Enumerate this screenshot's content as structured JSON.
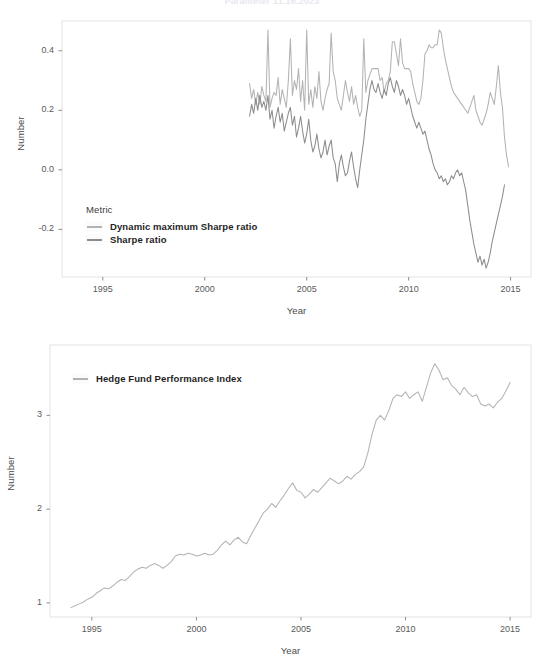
{
  "page": {
    "title": "Parameter 11.16.2023"
  },
  "chart_data": [
    {
      "type": "line",
      "id": "sharpe-ratios",
      "title": "",
      "xlabel": "Year",
      "ylabel": "Number",
      "xlim": [
        1993.0,
        2016.0
      ],
      "ylim": [
        -0.36,
        0.5
      ],
      "xticks": [
        1995,
        2000,
        2005,
        2010,
        2015
      ],
      "yticks": [
        -0.2,
        0.0,
        0.2,
        0.4
      ],
      "ytick_labels": [
        "-0.2",
        "0.0",
        "0.2",
        "0.4"
      ],
      "xtick_labels": [
        "1995",
        "2000",
        "2005",
        "2010",
        "2015"
      ],
      "grid": false,
      "legend": {
        "title": "Metric",
        "position": "inside-bottom-left",
        "entries": [
          {
            "label": "Dynamic maximum Sharpe ratio",
            "color": "#b3b3b3"
          },
          {
            "label": "Sharpe ratio",
            "color": "#8c8c8c"
          }
        ]
      },
      "series": [
        {
          "name": "Dynamic maximum Sharpe ratio",
          "color": "#b3b3b3",
          "x": [
            2002.2,
            2002.3,
            2002.4,
            2002.5,
            2002.6,
            2002.7,
            2002.8,
            2002.9,
            2003.0,
            2003.1,
            2003.2,
            2003.3,
            2003.4,
            2003.5,
            2003.6,
            2003.7,
            2003.8,
            2003.9,
            2004.0,
            2004.1,
            2004.2,
            2004.3,
            2004.4,
            2004.5,
            2004.6,
            2004.7,
            2004.8,
            2004.9,
            2005.0,
            2005.1,
            2005.2,
            2005.3,
            2005.4,
            2005.5,
            2005.6,
            2005.7,
            2005.8,
            2005.9,
            2006.0,
            2006.1,
            2006.2,
            2006.3,
            2006.4,
            2006.5,
            2006.6,
            2006.7,
            2006.8,
            2006.9,
            2007.0,
            2007.1,
            2007.2,
            2007.3,
            2007.4,
            2007.5,
            2007.6,
            2007.7,
            2007.8,
            2007.9,
            2008.0,
            2008.1,
            2008.2,
            2008.3,
            2008.4,
            2008.5,
            2008.6,
            2008.7,
            2008.8,
            2008.9,
            2009.0,
            2009.1,
            2009.2,
            2009.3,
            2009.4,
            2009.5,
            2009.6,
            2009.7,
            2009.8,
            2009.9,
            2010.0,
            2010.1,
            2010.2,
            2010.3,
            2010.4,
            2010.5,
            2010.6,
            2010.7,
            2010.8,
            2010.9,
            2011.0,
            2011.1,
            2011.2,
            2011.3,
            2011.4,
            2011.5,
            2011.6,
            2011.7,
            2011.8,
            2011.9,
            2012.0,
            2012.1,
            2012.2,
            2012.3,
            2012.4,
            2012.5,
            2012.6,
            2012.7,
            2012.8,
            2012.9,
            2013.0,
            2013.1,
            2013.2,
            2013.3,
            2013.4,
            2013.5,
            2013.6,
            2013.7,
            2013.8,
            2013.9,
            2014.0,
            2014.1,
            2014.2,
            2014.3,
            2014.4,
            2014.5,
            2014.6,
            2014.7,
            2014.8,
            2014.9
          ],
          "y": [
            0.29,
            0.24,
            0.27,
            0.22,
            0.26,
            0.22,
            0.28,
            0.25,
            0.23,
            0.47,
            0.21,
            0.24,
            0.26,
            0.25,
            0.31,
            0.22,
            0.27,
            0.24,
            0.21,
            0.3,
            0.44,
            0.25,
            0.3,
            0.27,
            0.34,
            0.23,
            0.3,
            0.2,
            0.47,
            0.22,
            0.27,
            0.21,
            0.28,
            0.24,
            0.33,
            0.23,
            0.2,
            0.24,
            0.27,
            0.29,
            0.46,
            0.33,
            0.3,
            0.24,
            0.22,
            0.2,
            0.25,
            0.3,
            0.26,
            0.23,
            0.28,
            0.22,
            0.25,
            0.21,
            0.18,
            0.2,
            0.44,
            0.26,
            0.3,
            0.32,
            0.34,
            0.34,
            0.34,
            0.34,
            0.3,
            0.31,
            0.26,
            0.29,
            0.3,
            0.33,
            0.43,
            0.43,
            0.39,
            0.35,
            0.44,
            0.36,
            0.34,
            0.34,
            0.34,
            0.33,
            0.29,
            0.26,
            0.23,
            0.22,
            0.24,
            0.3,
            0.39,
            0.4,
            0.42,
            0.41,
            0.41,
            0.42,
            0.42,
            0.47,
            0.46,
            0.41,
            0.37,
            0.34,
            0.31,
            0.28,
            0.26,
            0.25,
            0.24,
            0.23,
            0.22,
            0.21,
            0.2,
            0.19,
            0.21,
            0.23,
            0.25,
            0.2,
            0.18,
            0.16,
            0.15,
            0.17,
            0.19,
            0.22,
            0.26,
            0.24,
            0.22,
            0.28,
            0.35,
            0.26,
            0.21,
            0.11,
            0.05,
            0.01
          ],
          "stat_summary": "Volatile 0.15-0.48 band, no sustained drift"
        },
        {
          "name": "Sharpe ratio",
          "color": "#8c8c8c",
          "x": [
            2002.2,
            2002.3,
            2002.4,
            2002.5,
            2002.6,
            2002.7,
            2002.8,
            2002.9,
            2003.0,
            2003.1,
            2003.2,
            2003.3,
            2003.4,
            2003.5,
            2003.6,
            2003.7,
            2003.8,
            2003.9,
            2004.0,
            2004.1,
            2004.2,
            2004.3,
            2004.4,
            2004.5,
            2004.6,
            2004.7,
            2004.8,
            2004.9,
            2005.0,
            2005.1,
            2005.2,
            2005.3,
            2005.4,
            2005.5,
            2005.6,
            2005.7,
            2005.8,
            2005.9,
            2006.0,
            2006.1,
            2006.2,
            2006.3,
            2006.4,
            2006.5,
            2006.6,
            2006.7,
            2006.8,
            2006.9,
            2007.0,
            2007.1,
            2007.2,
            2007.3,
            2007.4,
            2007.5,
            2007.6,
            2007.7,
            2007.8,
            2007.9,
            2008.0,
            2008.1,
            2008.2,
            2008.3,
            2008.4,
            2008.5,
            2008.6,
            2008.7,
            2008.8,
            2008.9,
            2009.0,
            2009.1,
            2009.2,
            2009.3,
            2009.4,
            2009.5,
            2009.6,
            2009.7,
            2009.8,
            2009.9,
            2010.0,
            2010.1,
            2010.2,
            2010.3,
            2010.4,
            2010.5,
            2010.6,
            2010.7,
            2010.8,
            2010.9,
            2011.0,
            2011.1,
            2011.2,
            2011.3,
            2011.4,
            2011.5,
            2011.6,
            2011.7,
            2011.8,
            2011.9,
            2012.0,
            2012.1,
            2012.2,
            2012.3,
            2012.4,
            2012.5,
            2012.6,
            2012.7,
            2012.8,
            2012.9,
            2013.0,
            2013.1,
            2013.2,
            2013.3,
            2013.4,
            2013.5,
            2013.6,
            2013.7,
            2013.8,
            2013.9,
            2014.0,
            2014.1,
            2014.2,
            2014.3,
            2014.4,
            2014.5,
            2014.6,
            2014.7,
            2014.8,
            2014.9
          ],
          "y": [
            0.18,
            0.22,
            0.19,
            0.24,
            0.2,
            0.25,
            0.21,
            0.23,
            0.2,
            0.25,
            0.17,
            0.2,
            0.14,
            0.18,
            0.21,
            0.16,
            0.19,
            0.13,
            0.16,
            0.19,
            0.21,
            0.15,
            0.18,
            0.11,
            0.14,
            0.18,
            0.13,
            0.09,
            0.12,
            0.17,
            0.1,
            0.06,
            0.08,
            0.12,
            0.07,
            0.04,
            0.06,
            0.1,
            0.05,
            0.08,
            0.1,
            0.04,
            0.02,
            -0.04,
            0.02,
            0.05,
            0.01,
            -0.02,
            -0.01,
            0.03,
            0.06,
            0.01,
            -0.03,
            -0.06,
            0.0,
            0.05,
            0.1,
            0.17,
            0.22,
            0.27,
            0.3,
            0.27,
            0.26,
            0.29,
            0.26,
            0.24,
            0.27,
            0.25,
            0.29,
            0.31,
            0.28,
            0.26,
            0.3,
            0.28,
            0.25,
            0.27,
            0.25,
            0.22,
            0.24,
            0.21,
            0.18,
            0.16,
            0.14,
            0.16,
            0.14,
            0.12,
            0.13,
            0.1,
            0.07,
            0.05,
            0.02,
            0.0,
            -0.01,
            -0.03,
            -0.02,
            -0.04,
            -0.03,
            -0.05,
            -0.04,
            -0.02,
            -0.03,
            -0.01,
            0.0,
            -0.02,
            -0.01,
            -0.04,
            -0.07,
            -0.12,
            -0.17,
            -0.21,
            -0.25,
            -0.28,
            -0.31,
            -0.29,
            -0.32,
            -0.3,
            -0.33,
            -0.31,
            -0.28,
            -0.24,
            -0.21,
            -0.18,
            -0.15,
            -0.12,
            -0.09,
            -0.05
          ],
          "stat_summary": "Starts near 0.18, declines to about -0.33 by 2014, rebound at end"
        }
      ]
    },
    {
      "type": "line",
      "id": "hedge-fund-performance-index",
      "title": "",
      "xlabel": "Year",
      "ylabel": "Number",
      "xlim": [
        1993.0,
        2016.0
      ],
      "ylim": [
        0.85,
        3.75
      ],
      "xticks": [
        1995,
        2000,
        2005,
        2010,
        2015
      ],
      "yticks": [
        1,
        2,
        3
      ],
      "ytick_labels": [
        "1",
        "2",
        "3"
      ],
      "xtick_labels": [
        "1995",
        "2000",
        "2005",
        "2010",
        "2015"
      ],
      "grid": false,
      "legend": {
        "title": "",
        "position": "inside-top-left",
        "entries": [
          {
            "label": "Hedge Fund Performance Index",
            "color": "#b3b3b3"
          }
        ]
      },
      "series": [
        {
          "name": "Hedge Fund Performance Index",
          "color": "#b3b3b3",
          "x": [
            1994.0,
            1994.2,
            1994.4,
            1994.6,
            1994.8,
            1995.0,
            1995.2,
            1995.4,
            1995.6,
            1995.8,
            1996.0,
            1996.2,
            1996.4,
            1996.6,
            1996.8,
            1997.0,
            1997.2,
            1997.4,
            1997.6,
            1997.8,
            1998.0,
            1998.2,
            1998.4,
            1998.6,
            1998.8,
            1999.0,
            1999.2,
            1999.4,
            1999.6,
            1999.8,
            2000.0,
            2000.2,
            2000.4,
            2000.6,
            2000.8,
            2001.0,
            2001.2,
            2001.4,
            2001.6,
            2001.8,
            2002.0,
            2002.2,
            2002.4,
            2002.6,
            2002.8,
            2003.0,
            2003.2,
            2003.4,
            2003.6,
            2003.8,
            2004.0,
            2004.2,
            2004.4,
            2004.6,
            2004.8,
            2005.0,
            2005.2,
            2005.4,
            2005.6,
            2005.8,
            2006.0,
            2006.2,
            2006.4,
            2006.6,
            2006.8,
            2007.0,
            2007.2,
            2007.4,
            2007.6,
            2007.8,
            2008.0,
            2008.2,
            2008.4,
            2008.6,
            2008.8,
            2009.0,
            2009.2,
            2009.4,
            2009.6,
            2009.8,
            2010.0,
            2010.2,
            2010.4,
            2010.6,
            2010.8,
            2011.0,
            2011.2,
            2011.4,
            2011.6,
            2011.8,
            2012.0,
            2012.2,
            2012.4,
            2012.6,
            2012.8,
            2013.0,
            2013.2,
            2013.4,
            2013.6,
            2013.8,
            2014.0,
            2014.2,
            2014.4,
            2014.6,
            2014.8,
            2015.0
          ],
          "y": [
            0.95,
            0.97,
            0.99,
            1.01,
            1.04,
            1.06,
            1.1,
            1.13,
            1.16,
            1.15,
            1.18,
            1.22,
            1.25,
            1.24,
            1.28,
            1.33,
            1.36,
            1.38,
            1.37,
            1.4,
            1.42,
            1.4,
            1.37,
            1.4,
            1.44,
            1.5,
            1.52,
            1.51,
            1.53,
            1.52,
            1.5,
            1.51,
            1.53,
            1.51,
            1.52,
            1.56,
            1.62,
            1.66,
            1.62,
            1.67,
            1.7,
            1.65,
            1.63,
            1.72,
            1.8,
            1.88,
            1.96,
            2.0,
            2.06,
            2.02,
            2.09,
            2.15,
            2.22,
            2.28,
            2.2,
            2.18,
            2.12,
            2.16,
            2.21,
            2.18,
            2.23,
            2.28,
            2.33,
            2.3,
            2.27,
            2.3,
            2.35,
            2.32,
            2.37,
            2.4,
            2.45,
            2.6,
            2.8,
            2.95,
            3.0,
            2.95,
            3.05,
            3.18,
            3.22,
            3.2,
            3.25,
            3.18,
            3.22,
            3.25,
            3.15,
            3.3,
            3.45,
            3.55,
            3.48,
            3.38,
            3.4,
            3.32,
            3.28,
            3.22,
            3.3,
            3.24,
            3.2,
            3.22,
            3.12,
            3.1,
            3.12,
            3.08,
            3.14,
            3.18,
            3.26,
            3.35
          ],
          "stat_summary": "Monotonic-upward index from about 0.95 in 1994 to about 3.35 in 2015"
        }
      ]
    }
  ]
}
